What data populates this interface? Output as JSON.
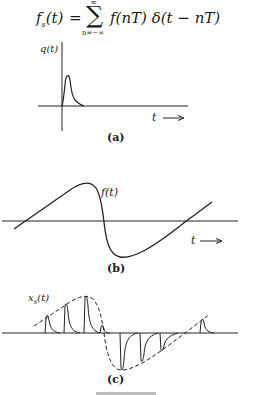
{
  "formula": {
    "lhs": "f",
    "lhs_sub": "s",
    "lhs_arg": "(t)",
    "equals": "=",
    "sum_symbol": "∑",
    "sum_upper": "∞",
    "sum_lower": "n=−∞",
    "rhs": "f(nT) δ(t − nT)"
  },
  "panels": [
    {
      "id": "a",
      "signal_label": "q(t)",
      "axis_label": "t ⟶",
      "caption": "(a)"
    },
    {
      "id": "b",
      "signal_label": "f(t)",
      "axis_label": "t ⟶",
      "caption": "(b)"
    },
    {
      "id": "c",
      "signal_label": "x_s(t)",
      "signal_label_main": "x",
      "signal_label_sub": "s",
      "signal_label_arg": "(t)",
      "caption": "(c)"
    }
  ],
  "figure_caption": "Figure"
}
